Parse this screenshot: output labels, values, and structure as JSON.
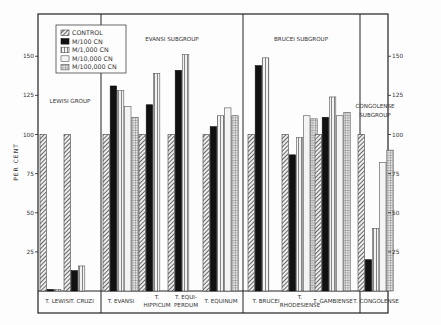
{
  "chart_data": {
    "type": "bar",
    "title": "",
    "xlabel": "",
    "ylabel": "PER CENT",
    "ylim": [
      0,
      165
    ],
    "yticks": [
      25,
      50,
      75,
      100,
      125,
      150
    ],
    "grid": false,
    "legend_position": "upper-left (inside)",
    "series": [
      {
        "name": "CONTROL",
        "pattern": "diagonal-hatch"
      },
      {
        "name": "M/100 CN",
        "pattern": "solid-black"
      },
      {
        "name": "M/1,000 CN",
        "pattern": "vertical-stripes"
      },
      {
        "name": "M/10,000 CN",
        "pattern": "light-outline"
      },
      {
        "name": "M/100,000 CN",
        "pattern": "crosshatch-grid"
      }
    ],
    "groups": [
      {
        "label": "LEWISI GROUP",
        "label_lines": [
          "LEWISI GROUP"
        ],
        "categories": [
          {
            "name": "T. LEWISI",
            "lines": [
              "T. LEWISI"
            ],
            "values": [
              100,
              1,
              1,
              null,
              null
            ]
          },
          {
            "name": "T. CRUZI",
            "lines": [
              "T. CRUZI"
            ],
            "values": [
              100,
              13,
              16,
              null,
              null
            ]
          }
        ]
      },
      {
        "label": "EVANSI SUBGROUP",
        "label_lines": [
          "EVANSI  SUBGROUP"
        ],
        "categories": [
          {
            "name": "T. EVANSI",
            "lines": [
              "T. EVANSI"
            ],
            "values": [
              100,
              131,
              128,
              118,
              111
            ]
          },
          {
            "name": "T. HIPPICUM",
            "lines": [
              "T.",
              "HIPPICUM"
            ],
            "values": [
              100,
              119,
              139,
              null,
              null
            ]
          },
          {
            "name": "T. EQUIPERDUM",
            "lines": [
              "T. EQUI-",
              "PERDUM"
            ],
            "values": [
              100,
              141,
              151,
              null,
              null
            ]
          },
          {
            "name": "T. EQUINUM",
            "lines": [
              "T. EQUINUM"
            ],
            "values": [
              100,
              105,
              112,
              117,
              112
            ]
          }
        ]
      },
      {
        "label": "BRUCEI SUBGROUP",
        "label_lines": [
          "BRUCEI  SUBGROUP"
        ],
        "categories": [
          {
            "name": "T. BRUCEI",
            "lines": [
              "T. BRUCEI"
            ],
            "values": [
              100,
              144,
              149,
              null,
              null
            ]
          },
          {
            "name": "T. RHODESIENSE",
            "lines": [
              "T.",
              "RHODESIENSE"
            ],
            "values": [
              100,
              87,
              98,
              112,
              110
            ]
          },
          {
            "name": "T. GAMBIENSE",
            "lines": [
              "T. GAMBIENSE"
            ],
            "values": [
              100,
              111,
              124,
              112,
              114
            ]
          }
        ]
      },
      {
        "label": "CONGOLENSE SUBGROUP",
        "label_lines": [
          "CONGOLENSE",
          "SUBGROUP"
        ],
        "categories": [
          {
            "name": "T. CONGOLENSE",
            "lines": [
              "T. CONGOLENSE"
            ],
            "values": [
              100,
              20,
              40,
              82,
              90
            ]
          }
        ]
      }
    ]
  },
  "axis": {
    "ylabel": "PER CENT",
    "left_ticks": [
      "25",
      "50",
      "75",
      "100",
      "125",
      "150"
    ],
    "right_ticks": [
      "25",
      "50",
      "75",
      "100",
      "125",
      "150"
    ]
  },
  "legend": {
    "items": [
      "CONTROL",
      "M/100 CN",
      "M/1,000 CN",
      "M/10,000 CN",
      "M/100,000 CN"
    ]
  }
}
